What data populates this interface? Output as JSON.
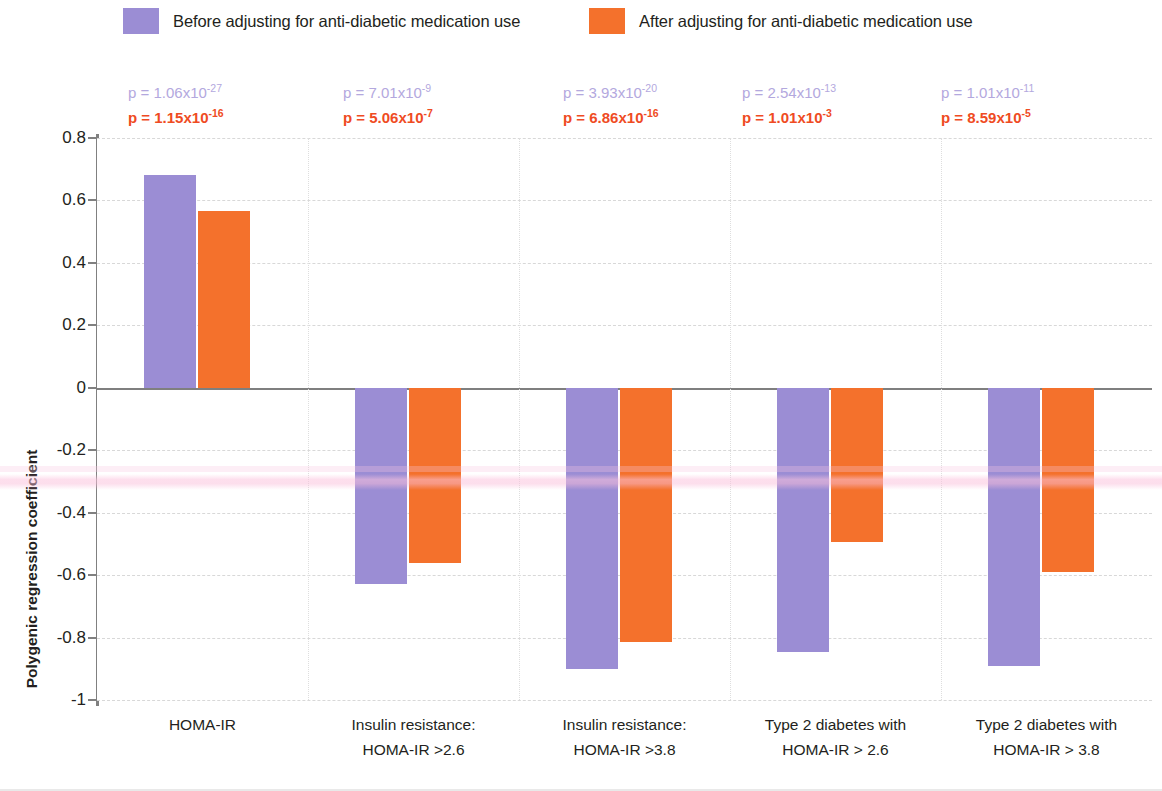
{
  "legend": {
    "items": [
      {
        "label": "Before adjusting for anti-diabetic medication use",
        "color": "#9b8dd4",
        "key": "before"
      },
      {
        "label": "After adjusting for anti-diabetic medication use",
        "color": "#f4712c",
        "key": "after"
      }
    ]
  },
  "axis": {
    "y_title": "Polygenic regression coefficient",
    "y_ticks": [
      "0.8",
      "0.6",
      "0.4",
      "0.2",
      "0",
      "-0.2",
      "-0.4",
      "-0.6",
      "-0.8",
      "-1"
    ]
  },
  "pvalues": [
    {
      "before": "p = 1.06x10",
      "before_exp": "-27",
      "after": "p = 1.15x10",
      "after_exp": "-16"
    },
    {
      "before": "p = 7.01x10",
      "before_exp": "-9",
      "after": "p = 5.06x10",
      "after_exp": "-7"
    },
    {
      "before": "p = 3.93x10",
      "before_exp": "-20",
      "after": "p = 6.86x10",
      "after_exp": "-16"
    },
    {
      "before": "p = 2.54x10",
      "before_exp": "-13",
      "after": "p = 1.01x10",
      "after_exp": "-3"
    },
    {
      "before": "p = 1.01x10",
      "before_exp": "-11",
      "after": "p = 8.59x10",
      "after_exp": "-5"
    }
  ],
  "category_labels": [
    {
      "line1": "HOMA-IR",
      "line2": ""
    },
    {
      "line1": "Insulin resistance:",
      "line2": "HOMA-IR >2.6"
    },
    {
      "line1": "Insulin resistance:",
      "line2": "HOMA-IR >3.8"
    },
    {
      "line1": "Type 2 diabetes with",
      "line2": "HOMA-IR > 2.6"
    },
    {
      "line1": "Type 2 diabetes with",
      "line2": "HOMA-IR > 3.8"
    }
  ],
  "chart_data": {
    "type": "bar",
    "title": "",
    "xlabel": "",
    "ylabel": "Polygenic regression coefficient",
    "ylim": [
      -1,
      0.8
    ],
    "ytick_step": 0.2,
    "grid": true,
    "legend_position": "top",
    "categories": [
      "HOMA-IR",
      "Insulin resistance: HOMA-IR >2.6",
      "Insulin resistance: HOMA-IR >3.8",
      "Type 2 diabetes with HOMA-IR > 2.6",
      "Type 2 diabetes with HOMA-IR > 3.8"
    ],
    "series": [
      {
        "name": "Before adjusting for anti-diabetic medication use",
        "color": "#9b8dd4",
        "values": [
          0.68,
          -0.63,
          -0.9,
          -0.845,
          -0.89
        ],
        "pvalues": [
          "1.06x10-27",
          "7.01x10-9",
          "3.93x10-20",
          "2.54x10-13",
          "1.01x10-11"
        ]
      },
      {
        "name": "After adjusting for anti-diabetic medication use",
        "color": "#f4712c",
        "values": [
          0.565,
          -0.56,
          -0.815,
          -0.495,
          -0.59
        ],
        "pvalues": [
          "1.15x10-16",
          "5.06x10-7",
          "6.86x10-16",
          "1.01x10-3",
          "8.59x10-5"
        ]
      }
    ]
  }
}
